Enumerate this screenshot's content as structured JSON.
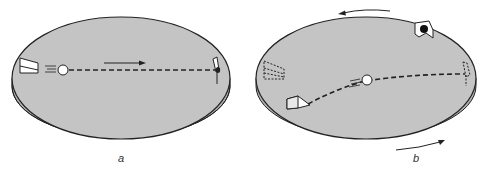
{
  "figure": {
    "panels": [
      {
        "id": "a",
        "label": "a",
        "description": "Non-rotating disk: ball travels in a straight line from thrower to catcher",
        "motion_arrow": "right",
        "path": "straight"
      },
      {
        "id": "b",
        "label": "b",
        "description": "Rotating disk: ball appears to follow a curved path; dashed outlines show original positions of thrower and catcher",
        "rotation": "counterclockwise",
        "path": "curved"
      }
    ],
    "colors": {
      "disk_top": "#c4c4c4",
      "disk_edge": "#b0b0b0",
      "outline": "#222222",
      "ball": "#ffffff",
      "background": "#ffffff"
    }
  }
}
